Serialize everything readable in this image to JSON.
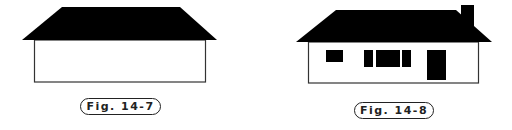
{
  "figures": [
    {
      "id": "fig-14-7",
      "caption": "Fig. 14-7",
      "description": "Simple house outline with black hip roof and plain rectangular wall, no windows or door",
      "colors": {
        "roof": "#000000",
        "wall_fill": "#ffffff",
        "wall_stroke": "#333333"
      }
    },
    {
      "id": "fig-14-8",
      "caption": "Fig. 14-8",
      "description": "House with black hip roof, chimney on right, one small window, a triple window, and a door",
      "elements": [
        "roof",
        "chimney",
        "small-window",
        "triple-window",
        "door"
      ],
      "colors": {
        "roof": "#000000",
        "wall_fill": "#ffffff",
        "wall_stroke": "#333333",
        "openings": "#000000"
      }
    }
  ]
}
